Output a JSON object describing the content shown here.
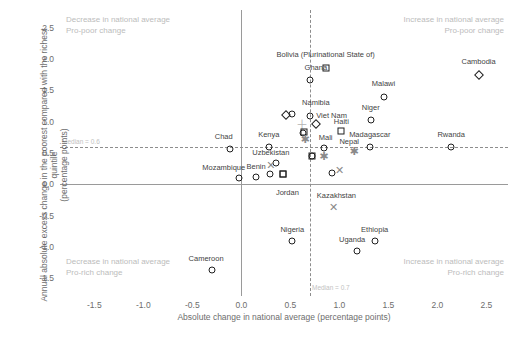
{
  "chart_data": {
    "type": "scatter",
    "title": "",
    "xlabel": "Absolute change in national average (percentage points)",
    "ylabel": "Annual absolute excess change in the poorest compared with the richest quintile (percentage points)",
    "ylabel_line1": "Annual absolute excess change in the poorest compared with the richest quintile",
    "ylabel_line2": "(percentage points)",
    "xlim": [
      -1.85,
      2.72
    ],
    "ylim": [
      -1.78,
      2.78
    ],
    "xticks": [
      -1.5,
      -1.0,
      -0.5,
      0.0,
      0.5,
      1.0,
      1.5,
      2.0,
      2.5
    ],
    "xticklabels": [
      "-1.5",
      "-1.0",
      "-0.5",
      "0.0",
      "0.5",
      "1.0",
      "1.5",
      "2.0",
      "2.5"
    ],
    "yticks": [
      -1.5,
      -1.0,
      -0.5,
      0.0,
      0.5,
      1.0,
      1.5,
      2.0,
      2.5
    ],
    "yticklabels": [
      "-1.5",
      "-1.0",
      "-0.5",
      "0.0",
      "0.5",
      "1.0",
      "1.5",
      "2.0",
      "2.5"
    ],
    "grid": false,
    "legend": "none",
    "median_x": 0.7,
    "median_y": 0.6,
    "median_x_label": "Median = 0.7",
    "median_y_label": "Median = 0.6",
    "annotations": [
      {
        "id": "top-left",
        "line1": "Decrease in national average",
        "line2": "Pro-poor change"
      },
      {
        "id": "top-right",
        "line1": "Increase in national average",
        "line2": "Pro-poor change"
      },
      {
        "id": "bottom-left",
        "line1": "Decrease in national average",
        "line2": "Pro-rich change"
      },
      {
        "id": "bottom-right",
        "line1": "Increase in national average",
        "line2": "Pro-rich change"
      }
    ],
    "points": [
      {
        "label": "Bolivia (Plurinational State of)",
        "x": 0.86,
        "y": 1.86,
        "marker": "square",
        "lx": 0.86,
        "ly": 2.06
      },
      {
        "label": "Cambodia",
        "x": 2.42,
        "y": 1.74,
        "marker": "diamond",
        "lx": 2.42,
        "ly": 1.95
      },
      {
        "label": "Ghana",
        "x": 0.7,
        "y": 1.66,
        "marker": "circle",
        "lx": 0.76,
        "ly": 1.86
      },
      {
        "label": "Malawi",
        "x": 1.45,
        "y": 1.4,
        "marker": "circle",
        "lx": 1.45,
        "ly": 1.6
      },
      {
        "label": "Namibia",
        "x": 0.7,
        "y": 1.09,
        "marker": "circle",
        "lx": 0.76,
        "ly": 1.29
      },
      {
        "label": "Niger",
        "x": 1.32,
        "y": 1.03,
        "marker": "circle",
        "lx": 1.32,
        "ly": 1.22
      },
      {
        "label": "Viet Nam",
        "x": 0.76,
        "y": 0.97,
        "marker": "diamond",
        "lx": 0.92,
        "ly": 1.09
      },
      {
        "label": "Haiti",
        "x": 1.02,
        "y": 0.85,
        "marker": "square",
        "lx": 1.02,
        "ly": 1.0
      },
      {
        "label": "",
        "x": 0.46,
        "y": 1.1,
        "marker": "diamond",
        "lx": 0,
        "ly": 0
      },
      {
        "label": "",
        "x": 0.52,
        "y": 1.12,
        "marker": "circle",
        "lx": 0,
        "ly": 0
      },
      {
        "label": "",
        "x": 0.6,
        "y": 0.93,
        "marker": "plus",
        "lx": 0,
        "ly": 0
      },
      {
        "label": "",
        "x": 0.63,
        "y": 0.82,
        "marker": "circle",
        "lx": 0,
        "ly": 0
      },
      {
        "label": "",
        "x": 0.64,
        "y": 0.84,
        "marker": "square",
        "lx": 0,
        "ly": 0
      },
      {
        "label": "",
        "x": 0.65,
        "y": 0.7,
        "marker": "asterisk",
        "lx": 0,
        "ly": 0
      },
      {
        "label": "Madagascar",
        "x": 1.31,
        "y": 0.6,
        "marker": "circle",
        "lx": 1.31,
        "ly": 0.78
      },
      {
        "label": "Rwanda",
        "x": 2.14,
        "y": 0.6,
        "marker": "circle",
        "lx": 2.14,
        "ly": 0.79
      },
      {
        "label": "Nepal",
        "x": 1.15,
        "y": 0.52,
        "marker": "asterisk",
        "lx": 1.1,
        "ly": 0.68
      },
      {
        "label": "Mali",
        "x": 0.84,
        "y": 0.58,
        "marker": "circle",
        "lx": 0.86,
        "ly": 0.74
      },
      {
        "label": "Kenya",
        "x": 0.28,
        "y": 0.6,
        "marker": "circle",
        "lx": 0.28,
        "ly": 0.79
      },
      {
        "label": "Chad",
        "x": -0.12,
        "y": 0.56,
        "marker": "circle",
        "lx": -0.18,
        "ly": 0.76
      },
      {
        "label": "Uzbekistan",
        "x": 0.35,
        "y": 0.34,
        "marker": "circle",
        "lx": 0.3,
        "ly": 0.5
      },
      {
        "label": "",
        "x": 0.72,
        "y": 0.46,
        "marker": "circle",
        "lx": 0,
        "ly": 0
      },
      {
        "label": "",
        "x": 0.72,
        "y": 0.45,
        "marker": "square",
        "lx": 0,
        "ly": 0
      },
      {
        "label": "",
        "x": 0.84,
        "y": 0.43,
        "marker": "asterisk",
        "lx": 0,
        "ly": 0
      },
      {
        "label": "",
        "x": 0.3,
        "y": 0.3,
        "marker": "cross",
        "lx": 0,
        "ly": 0
      },
      {
        "label": "",
        "x": 0.29,
        "y": 0.17,
        "marker": "circle",
        "lx": 0,
        "ly": 0
      },
      {
        "label": "",
        "x": 0.42,
        "y": 0.16,
        "marker": "square",
        "lx": 0,
        "ly": 0
      },
      {
        "label": "",
        "x": 0.92,
        "y": 0.18,
        "marker": "circle",
        "lx": 0,
        "ly": 0
      },
      {
        "label": "",
        "x": 1.0,
        "y": 0.22,
        "marker": "cross",
        "lx": 0,
        "ly": 0
      },
      {
        "label": "Mozambique",
        "x": -0.02,
        "y": 0.1,
        "marker": "circle",
        "lx": -0.18,
        "ly": 0.26
      },
      {
        "label": "Benin",
        "x": 0.15,
        "y": 0.11,
        "marker": "circle",
        "lx": 0.15,
        "ly": 0.28
      },
      {
        "label": "Jordan",
        "x": 0.42,
        "y": 0.16,
        "marker": "square",
        "lx": 0.47,
        "ly": -0.13
      },
      {
        "label": "Kazakhstan",
        "x": 0.94,
        "y": -0.38,
        "marker": "cross",
        "lx": 0.97,
        "ly": -0.18
      },
      {
        "label": "Ethiopia",
        "x": 1.36,
        "y": -0.9,
        "marker": "circle",
        "lx": 1.36,
        "ly": -0.72
      },
      {
        "label": "Uganda",
        "x": 1.18,
        "y": -1.07,
        "marker": "circle",
        "lx": 1.13,
        "ly": -0.89
      },
      {
        "label": "Nigeria",
        "x": 0.52,
        "y": -0.9,
        "marker": "circle",
        "lx": 0.52,
        "ly": -0.72
      },
      {
        "label": "Cameroon",
        "x": -0.3,
        "y": -1.37,
        "marker": "circle",
        "lx": -0.36,
        "ly": -1.19
      }
    ]
  }
}
